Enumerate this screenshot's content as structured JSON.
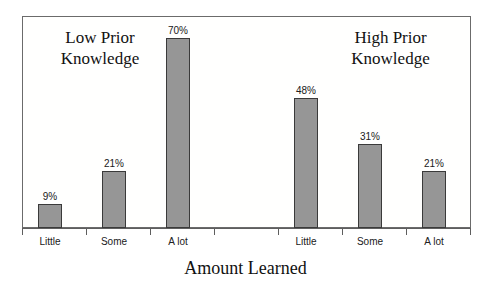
{
  "chart_data": {
    "type": "bar",
    "title": "",
    "xlabel": "Amount Learned",
    "ylabel": "",
    "ylim": [
      0,
      75
    ],
    "grid": false,
    "legend_position": "none",
    "categories": [
      "Little",
      "Some",
      "A lot",
      "",
      "Little",
      "Some",
      "A lot"
    ],
    "values": [
      9,
      21,
      70,
      null,
      48,
      31,
      21
    ],
    "value_labels": [
      "9%",
      "21%",
      "70%",
      "",
      "48%",
      "31%",
      "21%"
    ],
    "annotations": [
      {
        "text": "Low Prior\nKnowledge",
        "group": "low-prior-knowledge"
      },
      {
        "text": "High Prior\nKnowledge",
        "group": "high-prior-knowledge"
      }
    ],
    "groups": [
      {
        "name": "Low Prior Knowledge",
        "categories": [
          "Little",
          "Some",
          "A lot"
        ],
        "values": [
          9,
          21,
          70
        ]
      },
      {
        "name": "High Prior Knowledge",
        "categories": [
          "Little",
          "Some",
          "A lot"
        ],
        "values": [
          48,
          31,
          21
        ]
      }
    ],
    "bar_color": "#969696",
    "bar_edge_color": "#3a3a3a"
  },
  "axis": {
    "title": "Amount Learned",
    "tick_labels": [
      "Little",
      "Some",
      "A lot",
      "",
      "Little",
      "Some",
      "A lot"
    ]
  },
  "captions": {
    "low": "Low Prior\nKnowledge",
    "high": "High Prior\nKnowledge"
  },
  "bars": [
    {
      "label": "Little",
      "value_label": "9%",
      "value": 9
    },
    {
      "label": "Some",
      "value_label": "21%",
      "value": 21
    },
    {
      "label": "A lot",
      "value_label": "70%",
      "value": 70
    },
    {
      "label": "",
      "value_label": "",
      "value": 0
    },
    {
      "label": "Little",
      "value_label": "48%",
      "value": 48
    },
    {
      "label": "Some",
      "value_label": "31%",
      "value": 31
    },
    {
      "label": "A lot",
      "value_label": "21%",
      "value": 21
    }
  ]
}
